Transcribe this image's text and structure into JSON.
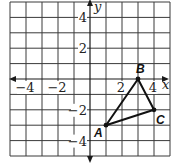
{
  "figure": {
    "type": "coordinate-grid",
    "grid": {
      "xmin": -5,
      "xmax": 5,
      "ymin": -5,
      "ymax": 5,
      "step": 1
    },
    "axes": {
      "x_label": "x",
      "y_label": "y",
      "x_ticks": [
        {
          "value": -4,
          "label": "−4"
        },
        {
          "value": -2,
          "label": "−2"
        },
        {
          "value": 2,
          "label": "2"
        },
        {
          "value": 4,
          "label": "4"
        }
      ],
      "y_ticks": [
        {
          "value": 4,
          "label": "4"
        },
        {
          "value": 2,
          "label": "2"
        },
        {
          "value": -2,
          "label": "−2"
        },
        {
          "value": -4,
          "label": "−4"
        }
      ]
    },
    "triangle": {
      "vertices": [
        {
          "name": "A",
          "x": 1,
          "y": -3
        },
        {
          "name": "B",
          "x": 3,
          "y": 0
        },
        {
          "name": "C",
          "x": 4,
          "y": -2
        }
      ]
    },
    "colors": {
      "grid": "#3a3a3a",
      "axes": "#1a1a1a",
      "triangle": "#111111",
      "background": "#ffffff"
    }
  }
}
